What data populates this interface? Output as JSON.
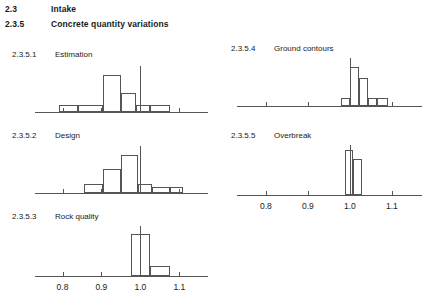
{
  "document": {
    "headings": [
      {
        "number": "2.3",
        "text": "Intake"
      },
      {
        "number": "2.3.5",
        "text": "Concrete quantity variations"
      }
    ]
  },
  "axis": {
    "tick_labels": [
      "0.8",
      "0.9",
      "1.0",
      "1.1"
    ],
    "tick_values": [
      0.8,
      0.9,
      1.0,
      1.1
    ],
    "range": [
      0.75,
      1.145
    ]
  },
  "panels": [
    {
      "number": "2.3.5.1",
      "title": "Estimation"
    },
    {
      "number": "2.3.5.2",
      "title": "Design"
    },
    {
      "number": "2.3.5.3",
      "title": "Rock quality"
    },
    {
      "number": "2.3.5.4",
      "title": "Ground contours"
    },
    {
      "number": "2.3.5.5",
      "title": "Overbreak"
    }
  ],
  "chart_data": [
    {
      "type": "bar",
      "title": "Estimation",
      "number": "2.3.5.1",
      "xlabel": "",
      "ylabel": "",
      "xlim": [
        0.75,
        1.145
      ],
      "grid": false,
      "xtick_labels": [
        "0.8",
        "0.9",
        "1.0",
        "1.1"
      ],
      "xticks": [
        0.8,
        0.9,
        1.0,
        1.1
      ],
      "reference_line": 1.0,
      "bin_edges": [
        0.79,
        0.84,
        0.905,
        0.95,
        0.99,
        1.025,
        1.075
      ],
      "values": [
        1,
        1,
        5,
        2.5,
        1,
        1
      ],
      "bars": [
        {
          "x0": 0.79,
          "x1": 0.84,
          "height": 1
        },
        {
          "x0": 0.84,
          "x1": 0.905,
          "height": 1
        },
        {
          "x0": 0.905,
          "x1": 0.95,
          "height": 5
        },
        {
          "x0": 0.95,
          "x1": 0.99,
          "height": 2.5
        },
        {
          "x0": 0.99,
          "x1": 1.025,
          "height": 1
        },
        {
          "x0": 1.025,
          "x1": 1.075,
          "height": 1
        }
      ],
      "ylim": [
        0,
        6.4
      ]
    },
    {
      "type": "bar",
      "title": "Design",
      "number": "2.3.5.2",
      "xlabel": "",
      "ylabel": "",
      "xlim": [
        0.75,
        1.145
      ],
      "grid": false,
      "xtick_labels": [
        "0.8",
        "0.9",
        "1.0",
        "1.1"
      ],
      "xticks": [
        0.8,
        0.9,
        1.0,
        1.1
      ],
      "reference_line": 1.0,
      "bin_edges": [
        0.855,
        0.905,
        0.95,
        0.995,
        1.03,
        1.075,
        1.11
      ],
      "values": [
        1,
        2.8,
        4.4,
        1,
        0.7,
        0.7
      ],
      "bars": [
        {
          "x0": 0.855,
          "x1": 0.905,
          "height": 1
        },
        {
          "x0": 0.905,
          "x1": 0.95,
          "height": 2.8
        },
        {
          "x0": 0.95,
          "x1": 0.995,
          "height": 4.4
        },
        {
          "x0": 0.995,
          "x1": 1.03,
          "height": 1
        },
        {
          "x0": 1.03,
          "x1": 1.075,
          "height": 0.7
        },
        {
          "x0": 1.075,
          "x1": 1.11,
          "height": 0.7
        }
      ],
      "ylim": [
        0,
        5.6
      ]
    },
    {
      "type": "bar",
      "title": "Rock quality",
      "number": "2.3.5.3",
      "xlabel": "",
      "ylabel": "",
      "xlim": [
        0.75,
        1.145
      ],
      "grid": false,
      "xtick_labels": [
        "0.8",
        "0.9",
        "1.0",
        "1.1"
      ],
      "xticks": [
        0.8,
        0.9,
        1.0,
        1.1
      ],
      "reference_line": 1.0,
      "bin_edges": [
        0.975,
        1.025,
        1.075
      ],
      "values": [
        5.2,
        1.3
      ],
      "bars": [
        {
          "x0": 0.975,
          "x1": 1.025,
          "height": 5.2
        },
        {
          "x0": 1.025,
          "x1": 1.075,
          "height": 1.3
        }
      ],
      "ylim": [
        0,
        6.2
      ]
    },
    {
      "type": "bar",
      "title": "Ground contours",
      "number": "2.3.5.4",
      "xlabel": "",
      "ylabel": "",
      "xlim": [
        0.755,
        1.145
      ],
      "grid": false,
      "xtick_labels": [
        "0.8",
        "0.9",
        "1.0",
        "1.1"
      ],
      "xticks": [
        0.8,
        0.9,
        1.0,
        1.1
      ],
      "reference_line": 1.0,
      "bin_edges": [
        0.978,
        1.0,
        1.022,
        1.043,
        1.065,
        1.09
      ],
      "values": [
        1,
        4.7,
        3.4,
        1,
        1
      ],
      "bars": [
        {
          "x0": 0.978,
          "x1": 1.0,
          "height": 1
        },
        {
          "x0": 1.0,
          "x1": 1.022,
          "height": 4.7
        },
        {
          "x0": 1.022,
          "x1": 1.043,
          "height": 3.4
        },
        {
          "x0": 1.043,
          "x1": 1.065,
          "height": 1
        },
        {
          "x0": 1.065,
          "x1": 1.09,
          "height": 1
        }
      ],
      "ylim": [
        0,
        5.8
      ]
    },
    {
      "type": "bar",
      "title": "Overbreak",
      "number": "2.3.5.5",
      "xlabel": "",
      "ylabel": "",
      "xlim": [
        0.755,
        1.145
      ],
      "grid": false,
      "xtick_labels": [
        "0.8",
        "0.9",
        "1.0",
        "1.1"
      ],
      "xticks": [
        0.8,
        0.9,
        1.0,
        1.1
      ],
      "reference_line": 1.0,
      "bin_edges": [
        0.988,
        1.008,
        1.03
      ],
      "values": [
        5.4,
        4.3
      ],
      "bars": [
        {
          "x0": 0.988,
          "x1": 1.008,
          "height": 5.4
        },
        {
          "x0": 1.008,
          "x1": 1.03,
          "height": 4.3
        }
      ],
      "ylim": [
        0,
        6.0
      ]
    }
  ]
}
